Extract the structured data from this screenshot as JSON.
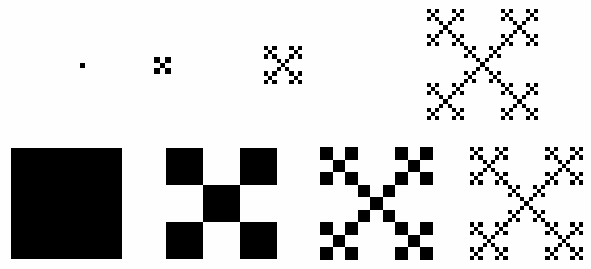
{
  "figure": {
    "background_color": "#fefefe",
    "ink_color": "#000000",
    "width": 591,
    "height": 269,
    "generator": {
      "grid": 3,
      "description": "3x3 grid keeping the four corner cells and the centre cell",
      "filled_cells": [
        [
          0,
          0
        ],
        [
          2,
          0
        ],
        [
          1,
          1
        ],
        [
          0,
          2
        ],
        [
          2,
          2
        ]
      ],
      "filled_count": 5,
      "total_cells": 9
    },
    "rows": [
      {
        "name": "top-row",
        "label": "shrinking-initiator series (constant smallest-square size)",
        "items": [
          {
            "name": "top-stage-0",
            "iteration": 0,
            "x": 80,
            "y": 63,
            "size": 5,
            "squares": 1
          },
          {
            "name": "top-stage-1",
            "iteration": 1,
            "x": 154,
            "y": 57,
            "size": 17,
            "squares": 5
          },
          {
            "name": "top-stage-2",
            "iteration": 2,
            "x": 264,
            "y": 46,
            "size": 38,
            "squares": 25
          },
          {
            "name": "top-stage-3",
            "iteration": 3,
            "x": 427,
            "y": 9,
            "size": 111,
            "squares": 125
          }
        ]
      },
      {
        "name": "bottom-row",
        "label": "constant-outer-size series",
        "items": [
          {
            "name": "bottom-stage-0",
            "iteration": 0,
            "x": 11,
            "y": 148,
            "size": 111,
            "squares": 1
          },
          {
            "name": "bottom-stage-1",
            "iteration": 1,
            "x": 166,
            "y": 148,
            "size": 111,
            "squares": 5
          },
          {
            "name": "bottom-stage-2",
            "iteration": 2,
            "x": 320,
            "y": 147,
            "size": 113,
            "squares": 25
          },
          {
            "name": "bottom-stage-3",
            "iteration": 3,
            "x": 470,
            "y": 147,
            "size": 113,
            "squares": 125
          }
        ]
      }
    ]
  },
  "chart_data": {
    "type": "diagram",
    "series": [
      {
        "name": "top-row",
        "iterations": [
          0,
          1,
          2,
          3
        ],
        "square_counts": [
          1,
          5,
          25,
          125
        ],
        "rendered_sizes_px": [
          5,
          17,
          38,
          111
        ],
        "unit_square_px": [
          5,
          5.67,
          4.22,
          4.11
        ]
      },
      {
        "name": "bottom-row",
        "iterations": [
          0,
          1,
          2,
          3
        ],
        "square_counts": [
          1,
          5,
          25,
          125
        ],
        "rendered_sizes_px": [
          111,
          111,
          113,
          113
        ],
        "unit_square_px": [
          111,
          37,
          12.56,
          4.19
        ]
      }
    ],
    "xlabel": "",
    "ylabel": "",
    "grid": false,
    "legend": false
  }
}
